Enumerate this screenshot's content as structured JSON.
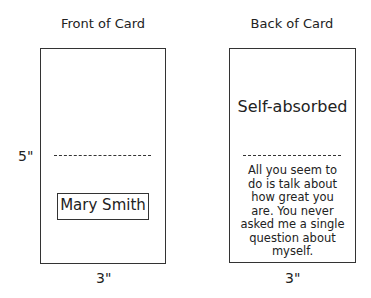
{
  "front": {
    "title": "Front of Card",
    "name_label": "Mary Smith",
    "height_label": "5\"",
    "width_label": "3\""
  },
  "back": {
    "title": "Back of Card",
    "heading": "Self-absorbed",
    "message": "All you seem to do is talk about how great you are. You never asked me a single question about myself.",
    "width_label": "3\""
  }
}
